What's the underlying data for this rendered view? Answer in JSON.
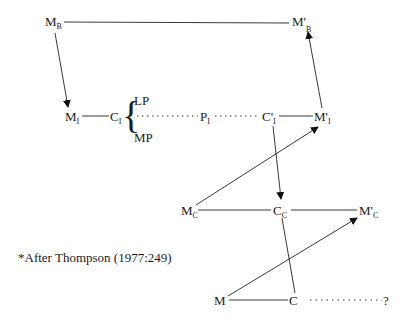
{
  "diagram": {
    "nodes": {
      "M_B": {
        "main": "M",
        "sub": "B"
      },
      "M_B_prime": {
        "main": "M'",
        "sub": "B"
      },
      "M_I": {
        "main": "M",
        "sub": "I"
      },
      "C_I": {
        "main": "C",
        "sub": "I"
      },
      "LP": {
        "main": "LP"
      },
      "MP": {
        "main": "MP"
      },
      "P_I": {
        "main": "P",
        "sub": "I"
      },
      "C_I_prime": {
        "main": "C'",
        "sub": "I"
      },
      "M_I_prime": {
        "main": "M'",
        "sub": "I"
      },
      "M_C": {
        "main": "M",
        "sub": "C"
      },
      "C_C": {
        "main": "C",
        "sub": "C"
      },
      "M_C_prime": {
        "main": "M'",
        "sub": "C"
      },
      "M": {
        "main": "M"
      },
      "C": {
        "main": "C"
      },
      "unknown": {
        "main": "?"
      }
    },
    "brace": "{",
    "edges": [
      {
        "from": "M_B",
        "to": "M_B_prime",
        "style": "solid",
        "arrow": false
      },
      {
        "from": "M_B",
        "to": "M_I",
        "style": "solid",
        "arrow": true
      },
      {
        "from": "M_I",
        "to": "C_I",
        "style": "solid",
        "arrow": false
      },
      {
        "from": "C_I",
        "to": "P_I",
        "style": "dotted",
        "arrow": false
      },
      {
        "from": "P_I",
        "to": "C_I_prime",
        "style": "dotted",
        "arrow": false
      },
      {
        "from": "C_I_prime",
        "to": "M_I_prime",
        "style": "solid",
        "arrow": false
      },
      {
        "from": "M_I_prime",
        "to": "M_B_prime",
        "style": "solid",
        "arrow": true
      },
      {
        "from": "C_I_prime",
        "to": "C_C",
        "style": "solid",
        "arrow": true
      },
      {
        "from": "M_C",
        "to": "M_I_prime",
        "style": "solid",
        "arrow": true
      },
      {
        "from": "M_C",
        "to": "C_C",
        "style": "solid",
        "arrow": false
      },
      {
        "from": "C_C",
        "to": "M_C_prime",
        "style": "solid",
        "arrow": false
      },
      {
        "from": "C_C",
        "to": "C",
        "style": "solid",
        "arrow": false
      },
      {
        "from": "M",
        "to": "M_C_prime",
        "style": "solid",
        "arrow": true
      },
      {
        "from": "M",
        "to": "C",
        "style": "solid",
        "arrow": false
      },
      {
        "from": "C",
        "to": "unknown",
        "style": "dotted",
        "arrow": false
      }
    ],
    "footnote": "*After Thompson (1977:249)"
  }
}
